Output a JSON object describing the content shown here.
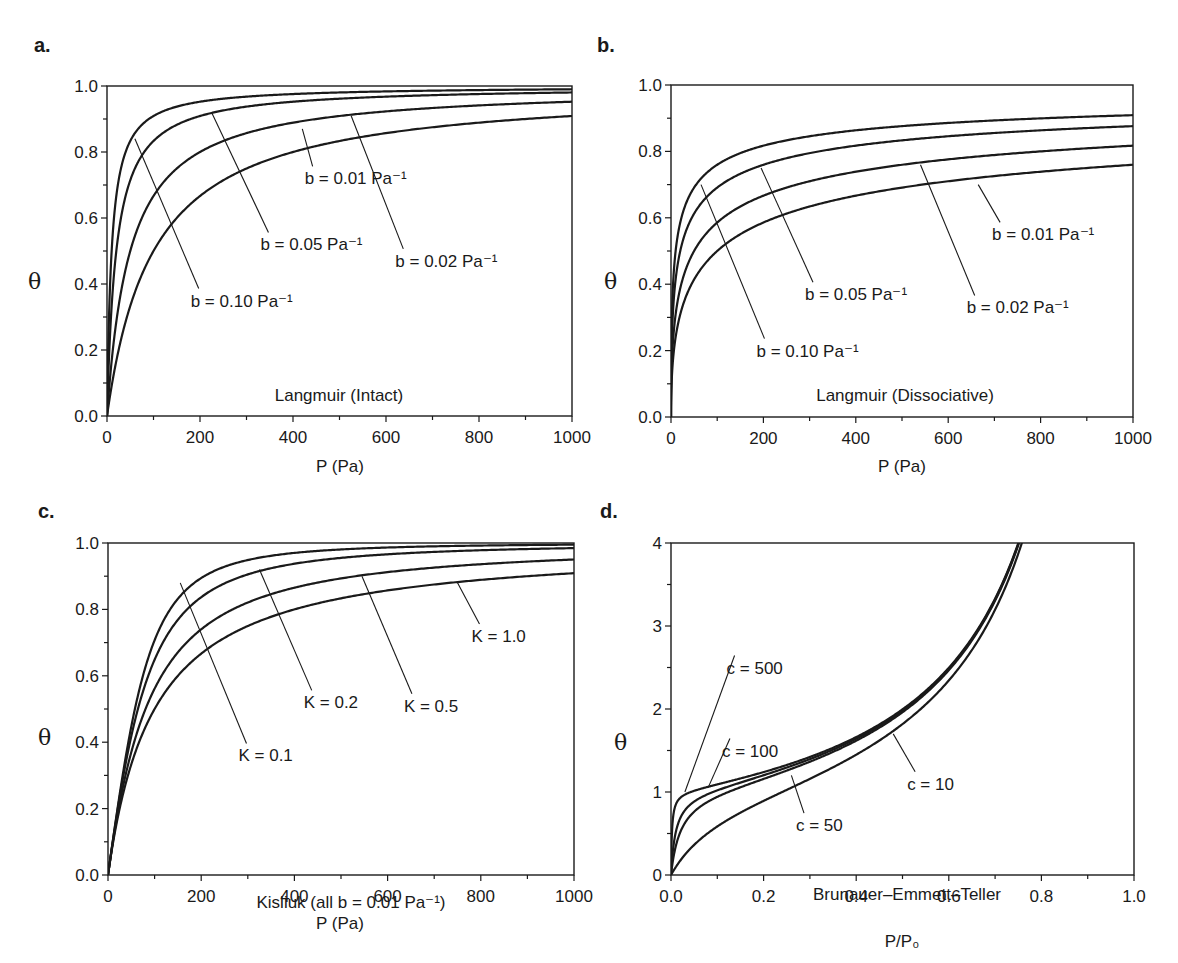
{
  "figure": {
    "panels": [
      {
        "id": "a",
        "letter": "a.",
        "title": "Langmuir (Intact)",
        "xlabel": "P (Pa)",
        "ylabel": "θ"
      },
      {
        "id": "b",
        "letter": "b.",
        "title": "Langmuir (Dissociative)",
        "xlabel": "P (Pa)",
        "ylabel": "θ"
      },
      {
        "id": "c",
        "letter": "c.",
        "title": "Kisliuk (all b = 0.01 Pa⁻¹)",
        "xlabel": "P (Pa)",
        "ylabel": "θ"
      },
      {
        "id": "d",
        "letter": "d.",
        "title": "Brunauer–Emmett–Teller",
        "xlabel": "P/P₀",
        "ylabel": "θ"
      }
    ],
    "line_color": "#1a1a1a",
    "background": "#ffffff"
  },
  "chart_data": [
    {
      "panel": "a",
      "type": "line",
      "title": "Langmuir (Intact)",
      "xlabel": "P (Pa)",
      "ylabel": "θ",
      "xlim": [
        0,
        1000
      ],
      "ylim": [
        0.0,
        1.0
      ],
      "xticks": [
        "0",
        "200",
        "400",
        "600",
        "800",
        "1000"
      ],
      "yticks": [
        "0.0",
        "0.2",
        "0.4",
        "0.6",
        "0.8",
        "1.0"
      ],
      "grid": false,
      "model": "theta = bP/(1+bP)",
      "x": [
        0,
        20,
        50,
        100,
        200,
        400,
        600,
        800,
        1000
      ],
      "series": [
        {
          "name": "b = 0.10 Pa⁻¹",
          "param": 0.1,
          "values": [
            0.0,
            0.67,
            0.83,
            0.91,
            0.95,
            0.98,
            0.98,
            0.99,
            0.99
          ]
        },
        {
          "name": "b = 0.05 Pa⁻¹",
          "param": 0.05,
          "values": [
            0.0,
            0.5,
            0.71,
            0.83,
            0.91,
            0.95,
            0.97,
            0.98,
            0.98
          ]
        },
        {
          "name": "b = 0.02 Pa⁻¹",
          "param": 0.02,
          "values": [
            0.0,
            0.29,
            0.5,
            0.67,
            0.8,
            0.89,
            0.92,
            0.94,
            0.95
          ]
        },
        {
          "name": "b = 0.01 Pa⁻¹",
          "param": 0.01,
          "values": [
            0.0,
            0.17,
            0.33,
            0.5,
            0.67,
            0.8,
            0.86,
            0.89,
            0.91
          ]
        }
      ],
      "annotations": [
        {
          "text": "b = 0.01 Pa⁻¹",
          "x": 425,
          "y": 0.72,
          "leader_to": [
            420,
            0.87
          ]
        },
        {
          "text": "b = 0.05 Pa⁻¹",
          "x": 330,
          "y": 0.52,
          "leader_to": [
            225,
            0.92
          ]
        },
        {
          "text": "b = 0.02 Pa⁻¹",
          "x": 620,
          "y": 0.47,
          "leader_to": [
            525,
            0.91
          ]
        },
        {
          "text": "b = 0.10 Pa⁻¹",
          "x": 180,
          "y": 0.35,
          "leader_to": [
            60,
            0.84
          ]
        },
        {
          "text": "Langmuir (Intact)",
          "x": 500,
          "y": 0.06
        }
      ]
    },
    {
      "panel": "b",
      "type": "line",
      "title": "Langmuir (Dissociative)",
      "xlabel": "P (Pa)",
      "ylabel": "θ",
      "xlim": [
        0,
        1000
      ],
      "ylim": [
        0.0,
        1.0
      ],
      "xticks": [
        "0",
        "200",
        "400",
        "600",
        "800",
        "1000"
      ],
      "yticks": [
        "0.0",
        "0.2",
        "0.4",
        "0.6",
        "0.8",
        "1.0"
      ],
      "grid": false,
      "model": "theta = sqrt(bP)/(1+sqrt(bP))",
      "x": [
        0,
        20,
        50,
        100,
        200,
        400,
        600,
        800,
        1000
      ],
      "series": [
        {
          "name": "b = 0.10 Pa⁻¹",
          "param": 0.1,
          "values": [
            0.0,
            0.59,
            0.69,
            0.76,
            0.82,
            0.86,
            0.89,
            0.9,
            0.91
          ]
        },
        {
          "name": "b = 0.05 Pa⁻¹",
          "param": 0.05,
          "values": [
            0.0,
            0.5,
            0.61,
            0.69,
            0.76,
            0.82,
            0.85,
            0.86,
            0.88
          ]
        },
        {
          "name": "b = 0.02 Pa⁻¹",
          "param": 0.02,
          "values": [
            0.0,
            0.39,
            0.5,
            0.59,
            0.67,
            0.74,
            0.78,
            0.8,
            0.82
          ]
        },
        {
          "name": "b = 0.01 Pa⁻¹",
          "param": 0.01,
          "values": [
            0.0,
            0.31,
            0.41,
            0.5,
            0.59,
            0.67,
            0.71,
            0.74,
            0.76
          ]
        }
      ],
      "annotations": [
        {
          "text": "b = 0.01 Pa⁻¹",
          "x": 695,
          "y": 0.55,
          "leader_to": [
            665,
            0.7
          ]
        },
        {
          "text": "b = 0.05 Pa⁻¹",
          "x": 290,
          "y": 0.37,
          "leader_to": [
            195,
            0.75
          ]
        },
        {
          "text": "b = 0.02 Pa⁻¹",
          "x": 640,
          "y": 0.33,
          "leader_to": [
            540,
            0.76
          ]
        },
        {
          "text": "b = 0.10 Pa⁻¹",
          "x": 185,
          "y": 0.2,
          "leader_to": [
            65,
            0.7
          ]
        },
        {
          "text": "Langmuir (Dissociative)",
          "x": 500,
          "y": 0.06
        }
      ]
    },
    {
      "panel": "c",
      "type": "line",
      "title": "Kisliuk (all b = 0.01 Pa⁻¹)",
      "xlabel": "P (Pa)",
      "ylabel": "θ",
      "xlim": [
        0,
        1000
      ],
      "ylim": [
        0.0,
        1.0
      ],
      "xticks": [
        "0",
        "200",
        "400",
        "600",
        "800",
        "1000"
      ],
      "yticks": [
        "0.0",
        "0.2",
        "0.4",
        "0.6",
        "0.8",
        "1.0"
      ],
      "grid": false,
      "x": [
        0,
        50,
        100,
        150,
        200,
        400,
        600,
        800,
        1000
      ],
      "series": [
        {
          "name": "K = 0.1",
          "param": 0.1,
          "sharpness": 2.0,
          "values": [
            0.0,
            0.45,
            0.71,
            0.83,
            0.89,
            0.97,
            0.98,
            0.99,
            0.99
          ]
        },
        {
          "name": "K = 0.2",
          "param": 0.2,
          "sharpness": 1.6,
          "values": [
            0.0,
            0.43,
            0.66,
            0.79,
            0.85,
            0.94,
            0.96,
            0.97,
            0.98
          ]
        },
        {
          "name": "K = 0.5",
          "param": 0.5,
          "sharpness": 1.2,
          "values": [
            0.0,
            0.38,
            0.58,
            0.7,
            0.76,
            0.87,
            0.91,
            0.93,
            0.95
          ]
        },
        {
          "name": "K = 1.0",
          "param": 1.0,
          "sharpness": 1.0,
          "values": [
            0.0,
            0.33,
            0.5,
            0.6,
            0.67,
            0.8,
            0.86,
            0.89,
            0.91
          ]
        }
      ],
      "annotations": [
        {
          "text": "K = 1.0",
          "x": 780,
          "y": 0.72,
          "leader_to": [
            750,
            0.88
          ]
        },
        {
          "text": "K = 0.2",
          "x": 420,
          "y": 0.52,
          "leader_to": [
            325,
            0.92
          ]
        },
        {
          "text": "K = 0.5",
          "x": 635,
          "y": 0.51,
          "leader_to": [
            545,
            0.9
          ]
        },
        {
          "text": "K = 0.1",
          "x": 280,
          "y": 0.36,
          "leader_to": [
            155,
            0.88
          ]
        },
        {
          "text": "Kisliuk (all b = 0.01 Pa⁻¹)",
          "x": 520,
          "y": 0.06
        }
      ]
    },
    {
      "panel": "d",
      "type": "line",
      "title": "Brunauer–Emmett–Teller",
      "xlabel": "P/P₀",
      "ylabel": "θ",
      "xlim": [
        0.0,
        1.0
      ],
      "ylim": [
        0,
        4
      ],
      "xticks": [
        "0.0",
        "0.2",
        "0.4",
        "0.6",
        "0.8",
        "1.0"
      ],
      "yticks": [
        "0",
        "1",
        "2",
        "3",
        "4"
      ],
      "grid": false,
      "model": "theta = c*x/((1-x)*(1-x+c*x))",
      "x": [
        0.0,
        0.02,
        0.05,
        0.1,
        0.2,
        0.3,
        0.4,
        0.5,
        0.6,
        0.7,
        0.75
      ],
      "series": [
        {
          "name": "c = 500",
          "param": 500,
          "values": [
            0.0,
            0.93,
            1.05,
            1.11,
            1.25,
            1.43,
            1.66,
            2.0,
            2.5,
            3.33,
            4.0
          ]
        },
        {
          "name": "c = 100",
          "param": 100,
          "values": [
            0.0,
            0.68,
            0.88,
            1.01,
            1.22,
            1.41,
            1.65,
            1.98,
            2.49,
            3.32,
            3.99
          ]
        },
        {
          "name": "c = 50",
          "param": 50,
          "values": [
            0.0,
            0.52,
            0.76,
            0.93,
            1.19,
            1.39,
            1.64,
            1.96,
            2.48,
            3.31,
            3.98
          ]
        },
        {
          "name": "c = 10",
          "param": 10,
          "values": [
            0.0,
            0.17,
            0.36,
            0.58,
            0.89,
            1.12,
            1.39,
            1.82,
            2.31,
            3.15,
            3.84
          ]
        }
      ],
      "annotations": [
        {
          "text": "c = 500",
          "x": 0.12,
          "y": 2.5,
          "leader_to": [
            0.03,
            1.0
          ]
        },
        {
          "text": "c = 100",
          "x": 0.11,
          "y": 1.5,
          "leader_to": [
            0.08,
            1.05
          ]
        },
        {
          "text": "c = 10",
          "x": 0.51,
          "y": 1.1,
          "leader_to": [
            0.48,
            1.7
          ]
        },
        {
          "text": "c = 50",
          "x": 0.27,
          "y": 0.6,
          "leader_to": [
            0.26,
            1.2
          ]
        },
        {
          "text": "Brunauer–Emmett–Teller",
          "x": 0.52,
          "y": 0.25
        }
      ]
    }
  ]
}
